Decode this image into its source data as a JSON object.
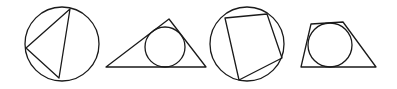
{
  "diagram": {
    "stroke_color": "#1a1a1a",
    "background": "#ffffff",
    "figures": [
      {
        "name": "triangle-inscribed-in-circle",
        "circle": {
          "cx": 62,
          "cy": 44,
          "r": 37
        },
        "polygon": "70,9 26,48 59,78"
      },
      {
        "name": "circle-inscribed-in-triangle",
        "circle": {
          "cx": 165,
          "cy": 47,
          "r": 20
        },
        "polygon": "106,67 169,19 206,67"
      },
      {
        "name": "quadrilateral-inscribed-in-circle",
        "circle": {
          "cx": 247,
          "cy": 44,
          "r": 37
        },
        "polygon": "225,18 267,14 282,58 239,80"
      },
      {
        "name": "circle-inscribed-in-trapezoid",
        "circle": {
          "cx": 330,
          "cy": 45,
          "r": 22
        },
        "polygon": "311,24 343,22 376,67 301,67"
      }
    ]
  }
}
